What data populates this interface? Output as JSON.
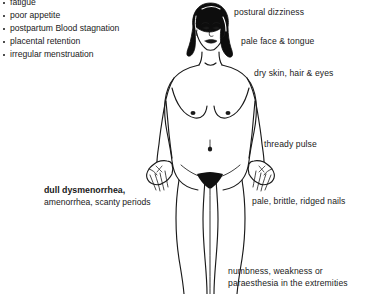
{
  "diagram": {
    "background_color": "#ffffff",
    "line_color": "#1a1a1a",
    "hair_color": "#0d0d0d"
  },
  "symptom_list": {
    "items": [
      "fatigue",
      "poor appetite",
      "postpartum Blood stagnation",
      "placental retention",
      "irregular menstruation"
    ]
  },
  "menstrual_block": {
    "primary": "dull dysmenorrhea,",
    "secondary": "amenorrhea, scanty periods"
  },
  "callouts": [
    {
      "id": "postural-dizziness",
      "text": "postural dizziness"
    },
    {
      "id": "pale-face-tongue",
      "text": "pale face & tongue"
    },
    {
      "id": "dry-skin-hair-eyes",
      "text": "dry skin, hair & eyes"
    },
    {
      "id": "thready-pulse",
      "text": "thready pulse"
    },
    {
      "id": "ridged-nails",
      "text": "pale, brittle, ridged nails"
    },
    {
      "id": "numbness-line1",
      "text": "numbness, weakness or"
    },
    {
      "id": "numbness-line2",
      "text": "paraesthesia in the extremities"
    }
  ]
}
